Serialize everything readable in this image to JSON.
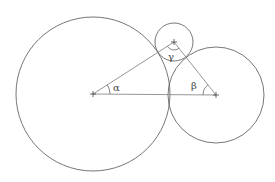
{
  "diagram": {
    "title": "",
    "colors": {
      "circle_stroke": "#666666",
      "triangle_stroke": "#8a8a8a",
      "label": "#444444",
      "background": "#ffffff"
    },
    "circles": [
      {
        "id": "large",
        "cx": 93,
        "cy": 94,
        "r": 77
      },
      {
        "id": "right",
        "cx": 216,
        "cy": 95,
        "r": 48
      },
      {
        "id": "small",
        "cx": 174,
        "cy": 42,
        "r": 19
      }
    ],
    "triangle": {
      "vertices": [
        {
          "name": "large-center",
          "x": 93,
          "y": 94
        },
        {
          "name": "right-center",
          "x": 216,
          "y": 95
        },
        {
          "name": "small-center",
          "x": 174,
          "y": 42
        }
      ]
    },
    "angles": [
      {
        "symbol": "α",
        "vertex": "large-center",
        "label_x": 113,
        "label_y": 91
      },
      {
        "symbol": "β",
        "vertex": "right-center",
        "label_x": 192,
        "label_y": 89
      },
      {
        "symbol": "γ",
        "vertex": "small-center",
        "label_x": 169,
        "label_y": 60
      }
    ]
  }
}
